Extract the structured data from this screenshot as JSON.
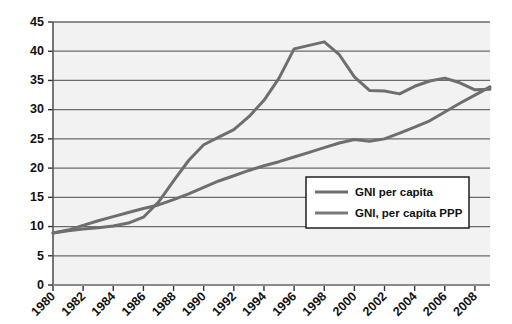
{
  "chart_data": {
    "type": "line",
    "title": "",
    "subtitle": "",
    "xlabel": "",
    "ylabel": "",
    "xlim": [
      1980,
      2009
    ],
    "ylim": [
      0,
      45
    ],
    "ytick_step": 5,
    "yticks": [
      0,
      5,
      10,
      15,
      20,
      25,
      30,
      35,
      40,
      45
    ],
    "xticks": [
      1980,
      1982,
      1984,
      1986,
      1988,
      1990,
      1992,
      1994,
      1996,
      1998,
      2000,
      2002,
      2004,
      2006,
      2008
    ],
    "xtick_labels": [
      "1980",
      "1982",
      "1984",
      "1986",
      "1988",
      "1990",
      "1992",
      "1994",
      "1996",
      "1998",
      "2000",
      "2002",
      "2004",
      "2006",
      "2008"
    ],
    "ytick_labels": [
      "0",
      "5",
      "10",
      "15",
      "20",
      "25",
      "30",
      "35",
      "40",
      "45"
    ],
    "grid": true,
    "grid_axis": "y",
    "legend_position": "inside-right-lower",
    "x": [
      1980,
      1981,
      1982,
      1983,
      1984,
      1985,
      1986,
      1987,
      1988,
      1989,
      1990,
      1991,
      1992,
      1993,
      1994,
      1995,
      1996,
      1997,
      1998,
      1999,
      2000,
      2001,
      2002,
      2003,
      2004,
      2005,
      2006,
      2007,
      2008,
      2009
    ],
    "series": [
      {
        "name": "GNI per capita",
        "color": "#6e6e6e",
        "values": [
          8.9,
          9.3,
          9.6,
          9.8,
          10.1,
          10.6,
          11.6,
          14.2,
          17.8,
          21.3,
          24.0,
          25.3,
          26.6,
          28.8,
          31.6,
          35.4,
          40.4,
          41.0,
          41.6,
          39.4,
          35.6,
          33.3,
          33.2,
          32.7,
          34.0,
          34.9,
          35.4,
          34.6,
          33.4,
          33.5
        ],
        "values_note": "annual series; peak 41.6 in 1998-era index position, trough near 32.7"
      },
      {
        "name": "GNI, per capita PPP",
        "color": "#6e6e6e",
        "values": [
          8.9,
          9.4,
          10.2,
          11.0,
          11.7,
          12.4,
          13.1,
          13.7,
          14.6,
          15.6,
          16.7,
          17.8,
          18.7,
          19.6,
          20.4,
          21.1,
          21.9,
          22.7,
          23.5,
          24.3,
          24.9,
          24.6,
          25.0,
          26.0,
          27.0,
          28.1,
          29.6,
          31.1,
          32.5,
          33.9
        ],
        "values_note": "steadily rising series"
      }
    ]
  },
  "legend": {
    "entries": [
      {
        "label": "GNI per capita"
      },
      {
        "label": "GNI, per capita PPP"
      }
    ]
  },
  "style": {
    "plot_background": "#f2f2f2",
    "grid_color": "#6b6b6b",
    "axis_color": "#555555",
    "line_color_1": "#6e6e6e",
    "line_color_2": "#7a7a7a",
    "text_color": "#111111",
    "page_background": "#ffffff",
    "legend_background": "#ffffff",
    "legend_border": "#111111"
  }
}
